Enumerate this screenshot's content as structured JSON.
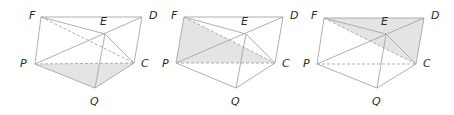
{
  "figures": [
    {
      "id": "figure-1",
      "shaded_face": [
        "P",
        "Q",
        "C"
      ],
      "vertices": {
        "F": {
          "label": "F",
          "x": 41,
          "y": 17,
          "lx": 29,
          "ly": 19
        },
        "D": {
          "label": "D",
          "x": 142,
          "y": 17,
          "lx": 149,
          "ly": 19
        },
        "E": {
          "label": "E",
          "x": 105,
          "y": 34,
          "lx": 100,
          "ly": 25
        },
        "P": {
          "label": "P",
          "x": 35,
          "y": 64,
          "lx": 20,
          "ly": 67
        },
        "C": {
          "label": "C",
          "x": 134,
          "y": 63,
          "lx": 141,
          "ly": 67
        },
        "Q": {
          "label": "Q",
          "x": 95,
          "y": 88,
          "lx": 90,
          "ly": 105
        }
      }
    },
    {
      "id": "figure-2",
      "shaded_face": [
        "F",
        "P",
        "C"
      ],
      "vertices": {
        "F": {
          "label": "F",
          "x": 184,
          "y": 17,
          "lx": 171,
          "ly": 19
        },
        "D": {
          "label": "D",
          "x": 283,
          "y": 17,
          "lx": 290,
          "ly": 19
        },
        "E": {
          "label": "E",
          "x": 246,
          "y": 34,
          "lx": 241,
          "ly": 25
        },
        "P": {
          "label": "P",
          "x": 176,
          "y": 63,
          "lx": 162,
          "ly": 67
        },
        "C": {
          "label": "C",
          "x": 275,
          "y": 63,
          "lx": 282,
          "ly": 67
        },
        "Q": {
          "label": "Q",
          "x": 236,
          "y": 88,
          "lx": 231,
          "ly": 105
        }
      }
    },
    {
      "id": "figure-3",
      "shaded_face": [
        "F",
        "D",
        "C"
      ],
      "vertices": {
        "F": {
          "label": "F",
          "x": 324,
          "y": 18,
          "lx": 311,
          "ly": 19
        },
        "D": {
          "label": "D",
          "x": 424,
          "y": 18,
          "lx": 431,
          "ly": 19
        },
        "E": {
          "label": "E",
          "x": 386,
          "y": 34,
          "lx": 381,
          "ly": 25
        },
        "P": {
          "label": "P",
          "x": 317,
          "y": 64,
          "lx": 303,
          "ly": 67
        },
        "C": {
          "label": "C",
          "x": 416,
          "y": 64,
          "lx": 423,
          "ly": 67
        },
        "Q": {
          "label": "Q",
          "x": 377,
          "y": 88,
          "lx": 372,
          "ly": 105
        }
      }
    }
  ],
  "edges": {
    "solid": [
      [
        "F",
        "D"
      ],
      [
        "F",
        "E"
      ],
      [
        "F",
        "P"
      ],
      [
        "D",
        "C"
      ],
      [
        "P",
        "D"
      ],
      [
        "E",
        "C"
      ],
      [
        "E",
        "Q"
      ],
      [
        "P",
        "Q"
      ],
      [
        "Q",
        "C"
      ]
    ],
    "dashed": [
      [
        "F",
        "C"
      ],
      [
        "P",
        "C"
      ]
    ]
  },
  "colors": {
    "edge": "#a6a6a6",
    "shade": "#e4e4e4",
    "label": "#2a2a2a"
  }
}
